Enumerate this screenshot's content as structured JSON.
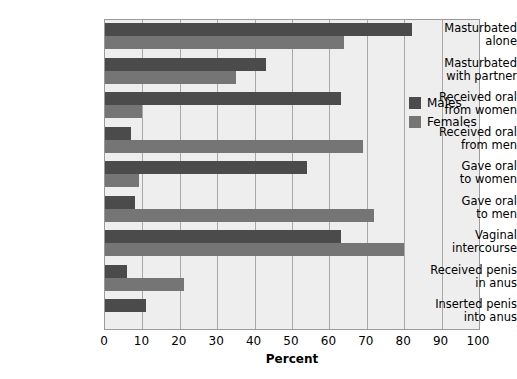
{
  "chart_data": {
    "type": "bar",
    "orientation": "horizontal",
    "title": "",
    "xlabel": "Percent",
    "ylabel": "",
    "xlim": [
      0,
      100
    ],
    "xticks": [
      0,
      10,
      20,
      30,
      40,
      50,
      60,
      70,
      80,
      90,
      100
    ],
    "xticklabels": [
      "0",
      "10",
      "20",
      "30",
      "40",
      "50",
      "60",
      "70",
      "80",
      "90",
      "100"
    ],
    "grid": true,
    "grid_axis": "x",
    "legend": {
      "position": "inside-right",
      "entries": [
        {
          "name": "Males",
          "color": "#4b4b4b"
        },
        {
          "name": "Females",
          "color": "#757575"
        }
      ]
    },
    "categories": [
      {
        "line1": "Masturbated",
        "line2": "alone"
      },
      {
        "line1": "Masturbated",
        "line2": "with partner"
      },
      {
        "line1": "Received oral",
        "line2": "from women"
      },
      {
        "line1": "Received oral",
        "line2": "from men"
      },
      {
        "line1": "Gave oral",
        "line2": "to women"
      },
      {
        "line1": "Gave oral",
        "line2": "to men"
      },
      {
        "line1": "Vaginal",
        "line2": "intercourse"
      },
      {
        "line1": "Received penis",
        "line2": "in anus"
      },
      {
        "line1": "Inserted penis",
        "line2": "into anus"
      }
    ],
    "series": [
      {
        "name": "Males",
        "color": "#4b4b4b",
        "values": [
          82,
          43,
          63,
          7,
          54,
          8,
          63,
          6,
          11
        ]
      },
      {
        "name": "Females",
        "color": "#757575",
        "values": [
          64,
          35,
          10,
          69,
          9,
          72,
          80,
          21,
          0
        ]
      }
    ]
  },
  "axis": {
    "x_title": "Percent"
  }
}
